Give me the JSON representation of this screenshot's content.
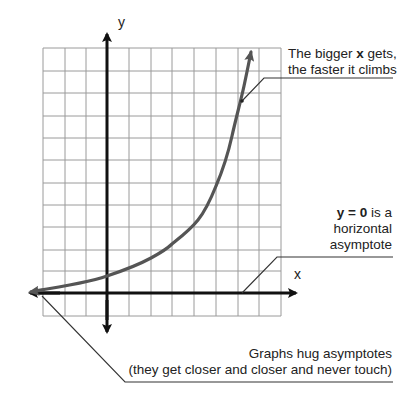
{
  "diagram": {
    "axes": {
      "x_label": "x",
      "y_label": "y"
    },
    "grid": {
      "columns": 11,
      "rows": 12,
      "color": "#9a9a9a"
    },
    "curve": {
      "type": "exponential",
      "color": "#555555"
    },
    "annotations": {
      "growth": {
        "line1_pre": "The bigger ",
        "line1_bold": "x",
        "line1_post": " gets,",
        "line2": "the faster it climbs"
      },
      "asymptote": {
        "line1_bold": "y = 0",
        "line1_post": " is a",
        "line2": "horizontal",
        "line3": "asymptote"
      },
      "hug": {
        "line1": "Graphs hug asymptotes",
        "line2": "(they get closer and closer and never touch)"
      }
    }
  }
}
